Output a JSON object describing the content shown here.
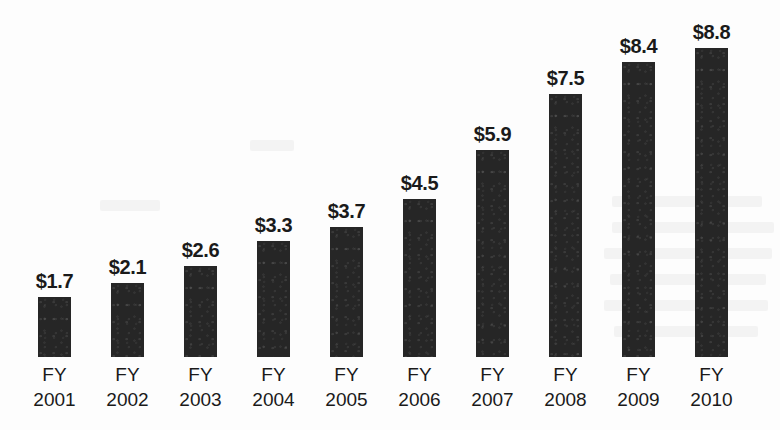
{
  "chart_data": {
    "type": "bar",
    "title": "",
    "subtitle": "",
    "xlabel": "",
    "ylabel": "",
    "ylim": [
      0,
      8.8
    ],
    "grid": false,
    "legend": null,
    "value_prefix": "$",
    "categories": [
      "FY 2001",
      "FY 2002",
      "FY 2003",
      "FY 2004",
      "FY 2005",
      "FY 2006",
      "FY 2007",
      "FY 2008",
      "FY 2009",
      "FY 2010"
    ],
    "category_prefixes": [
      "FY",
      "FY",
      "FY",
      "FY",
      "FY",
      "FY",
      "FY",
      "FY",
      "FY",
      "FY"
    ],
    "category_years": [
      "2001",
      "2002",
      "2003",
      "2004",
      "2005",
      "2006",
      "2007",
      "2008",
      "2009",
      "2010"
    ],
    "values": [
      1.7,
      2.1,
      2.6,
      3.3,
      3.7,
      4.5,
      5.9,
      7.5,
      8.4,
      8.8
    ],
    "value_labels": [
      "$1.7",
      "$2.1",
      "$2.6",
      "$3.3",
      "$3.7",
      "$4.5",
      "$5.9",
      "$7.5",
      "$8.4",
      "$8.8"
    ],
    "series": [
      {
        "name": "",
        "values": [
          1.7,
          2.1,
          2.6,
          3.3,
          3.7,
          4.5,
          5.9,
          7.5,
          8.4,
          8.8
        ]
      }
    ],
    "colors": {
      "bar_fill": "#262626",
      "text": "#1a1a1a",
      "background": "#fdfdfd"
    }
  },
  "bars": [
    {
      "label": "$1.7",
      "value": 1.7,
      "prefix": "FY",
      "year": "2001"
    },
    {
      "label": "$2.1",
      "value": 2.1,
      "prefix": "FY",
      "year": "2002"
    },
    {
      "label": "$2.6",
      "value": 2.6,
      "prefix": "FY",
      "year": "2003"
    },
    {
      "label": "$3.3",
      "value": 3.3,
      "prefix": "FY",
      "year": "2004"
    },
    {
      "label": "$3.7",
      "value": 3.7,
      "prefix": "FY",
      "year": "2005"
    },
    {
      "label": "$4.5",
      "value": 4.5,
      "prefix": "FY",
      "year": "2006"
    },
    {
      "label": "$5.9",
      "value": 5.9,
      "prefix": "FY",
      "year": "2007"
    },
    {
      "label": "$7.5",
      "value": 7.5,
      "prefix": "FY",
      "year": "2008"
    },
    {
      "label": "$8.4",
      "value": 8.4,
      "prefix": "FY",
      "year": "2009"
    },
    {
      "label": "$8.8",
      "value": 8.8,
      "prefix": "FY",
      "year": "2010"
    }
  ]
}
